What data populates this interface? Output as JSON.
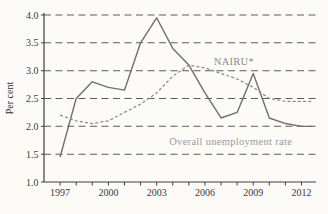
{
  "page": {
    "background_color": "#fcfbf7",
    "axis_color": "#3f3f3f",
    "grid_color": "#5c5c5c",
    "tick_label_color": "#3a3a3a"
  },
  "chart_data": {
    "type": "line",
    "title": "",
    "xlabel": "",
    "ylabel": "Per cent",
    "xlim": [
      1996,
      2012.9
    ],
    "ylim": [
      1.0,
      4.0
    ],
    "grid": {
      "horizontal": true,
      "style": "dashed"
    },
    "legend_position": "inline-annotations",
    "x": [
      1997,
      1998,
      1999,
      2000,
      2001,
      2002,
      2003,
      2004,
      2005,
      2006,
      2007,
      2008,
      2009,
      2010,
      2011,
      2012
    ],
    "x_tick_years": [
      1997,
      2000,
      2003,
      2006,
      2009,
      2012
    ],
    "x_tick_labels": [
      "1997",
      "2000",
      "2003",
      "2006",
      "2009",
      "2012"
    ],
    "y_ticks": [
      1.0,
      1.5,
      2.0,
      2.5,
      3.0,
      3.5,
      4.0
    ],
    "y_tick_labels": [
      "1.0",
      "1.5",
      "2.0",
      "2.5",
      "3.0",
      "3.5",
      "4.0"
    ],
    "series": [
      {
        "name": "Overall unemployment rate",
        "line_style": "solid",
        "color": "#6f6f6f",
        "values": [
          1.45,
          2.5,
          2.8,
          2.7,
          2.65,
          3.5,
          3.95,
          3.4,
          3.1,
          2.6,
          2.15,
          2.25,
          2.95,
          2.15,
          2.05,
          2.0
        ]
      },
      {
        "name": "NAIRU*",
        "line_style": "dashed",
        "color": "#8b8b8b",
        "values": [
          2.2,
          2.1,
          2.05,
          2.1,
          2.25,
          2.4,
          2.6,
          2.9,
          3.1,
          3.05,
          2.95,
          2.85,
          2.7,
          2.5,
          2.45,
          2.45
        ]
      }
    ],
    "annotations": [
      {
        "id": "nairu-label",
        "text": "NAIRU*",
        "x": 2007.8,
        "y": 3.17,
        "color": "#8a8a8a"
      },
      {
        "id": "unemployment-label",
        "text": "Overall unemployment rate",
        "x": 2007.6,
        "y": 1.72,
        "color": "#9a9a9a"
      }
    ]
  }
}
